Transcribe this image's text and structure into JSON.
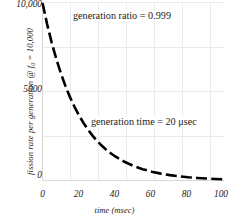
{
  "chart_data": {
    "type": "line",
    "title": "",
    "subtitle": "",
    "xlabel": "time (msec)",
    "ylabel_prefix": "fission rate per generation @ f",
    "ylabel_sub": "0",
    "ylabel_suffix": " = 10,000",
    "ylabel_full": "fission rate per generation @ f0 = 10,000",
    "xlim": [
      0,
      100
    ],
    "ylim": [
      0,
      10000
    ],
    "xticks": [
      0,
      20,
      40,
      60,
      80,
      100
    ],
    "xtick_labels": [
      "0",
      "20",
      "40",
      "60",
      "80",
      "100"
    ],
    "yticks": [
      0,
      5000,
      10000
    ],
    "ytick_labels": [
      "0",
      "5000",
      "10,000"
    ],
    "grid": true,
    "grid_color": "#ebebeb",
    "legend": "none",
    "series": [
      {
        "name": "fission rate per generation",
        "style": "dashed",
        "color": "#000000",
        "linewidth": 2.6,
        "x": [
          0,
          2.5,
          5,
          7.5,
          10,
          12.5,
          15,
          17.5,
          20,
          22.5,
          25,
          27.5,
          30,
          32.5,
          35,
          37.5,
          40,
          45,
          50,
          55,
          60,
          65,
          70,
          75,
          80,
          85,
          90,
          95,
          100
        ],
        "y": [
          10000,
          8825,
          7788,
          6873,
          6065,
          5353,
          4724,
          4169,
          3679,
          3247,
          2865,
          2528,
          2231,
          1969,
          1738,
          1534,
          1353,
          1054,
          821,
          639,
          498,
          388,
          302,
          235,
          183,
          143,
          111,
          87,
          67
        ]
      }
    ],
    "annotations": [
      {
        "text": "generation ratio = 0.999",
        "x": 28,
        "y": 9300
      },
      {
        "text": "generation time = 20 μsec",
        "x": 38,
        "y": 3650
      }
    ]
  },
  "axis": {
    "xlabel": "time (msec)",
    "ylabel_prefix": "fission rate per generation @ f",
    "ylabel_sub": "0",
    "ylabel_suffix": " = 10,000",
    "ytick_10000": "10,000",
    "ytick_5000": "5000",
    "ytick_0": "0",
    "xtick_0": "0",
    "xtick_20": "20",
    "xtick_40": "40",
    "xtick_60": "60",
    "xtick_80": "80",
    "xtick_100": "100"
  },
  "annotations": {
    "generation_ratio": "generation ratio = 0.999",
    "generation_time": "generation time = 20 μsec"
  },
  "colors": {
    "curve": "#000000",
    "grid": "#ebebeb",
    "text": "#1a1a1a",
    "background": "#ffffff"
  }
}
